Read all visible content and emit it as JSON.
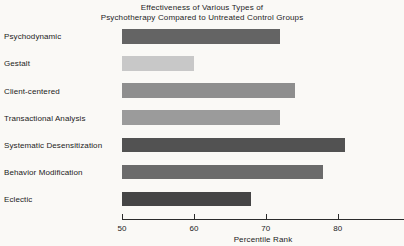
{
  "title": {
    "line1": "Effectiveness of Various Types of",
    "line2": "Psychotherapy Compared to Untreated Control Groups"
  },
  "chart_data": {
    "type": "bar",
    "orientation": "horizontal",
    "title": "Effectiveness of Various Types of Psychotherapy Compared to Untreated Control Groups",
    "categories": [
      "Psychodynamic",
      "Gestalt",
      "Client-centered",
      "Transactional Analysis",
      "Systematic Desensitization",
      "Behavior Modification",
      "Eclectic"
    ],
    "values": [
      72,
      60,
      74,
      72,
      81,
      78,
      68
    ],
    "bar_colors": [
      "#646464",
      "#c8c8c8",
      "#8e8e8e",
      "#9b9b9b",
      "#525252",
      "#6b6b6b",
      "#454545"
    ],
    "xlabel": "Percentile Rank",
    "xlim": [
      50,
      89
    ],
    "xticks": [
      50,
      60,
      70,
      80
    ],
    "grid": false,
    "legend": null,
    "axis_color": "#2b2b2b"
  }
}
